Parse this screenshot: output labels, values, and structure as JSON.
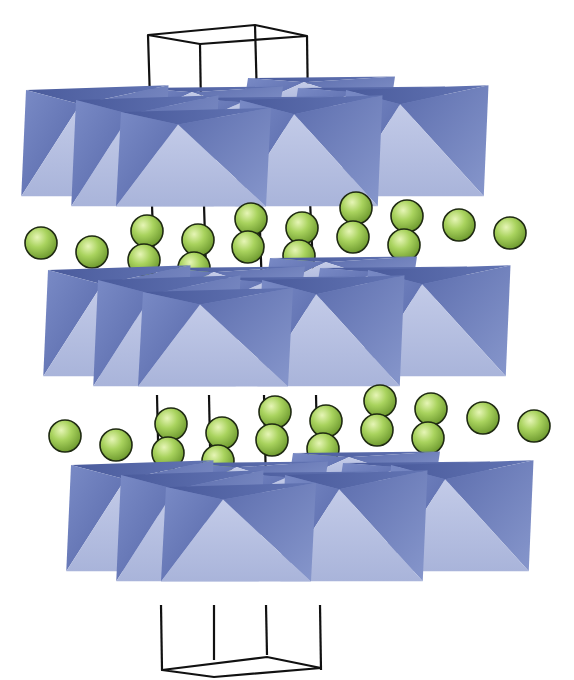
{
  "figure": {
    "type": "crystal-structure",
    "colors": {
      "octahedron_front": "#b7c1e2",
      "octahedron_side": "#6577b3",
      "octahedron_top": "#4d5e9f",
      "sphere": "#a6cf5c",
      "unit_cell": "#111111",
      "background": "#ffffff"
    },
    "layers": [
      {
        "name": "octahedral-layer-1",
        "offset_y": 0
      },
      {
        "name": "octahedral-layer-2",
        "offset_y": 178
      },
      {
        "name": "octahedral-layer-3",
        "offset_y": 378
      }
    ],
    "interlayer_rows": [
      {
        "name": "cation-row-1",
        "offset_x": 0,
        "offset_y": 0
      },
      {
        "name": "cation-row-2",
        "offset_x": 23,
        "offset_y": 194
      }
    ],
    "sphere_count_per_row": 16
  }
}
